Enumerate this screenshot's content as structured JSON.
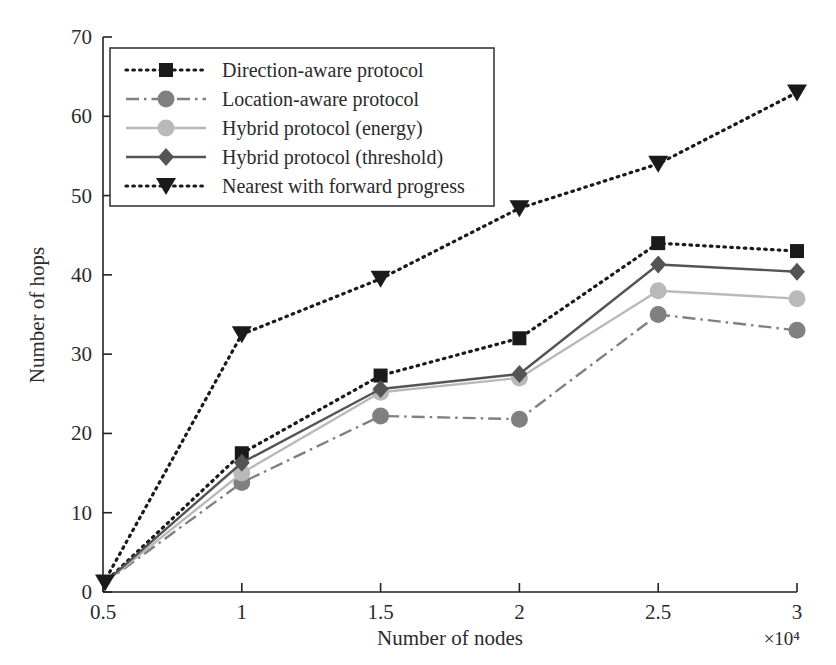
{
  "chart_data": {
    "type": "line",
    "title": "",
    "xlabel": "Number of nodes",
    "ylabel": "Number of hops",
    "x_exponent_label": "×10⁴",
    "x": [
      0.5,
      1,
      1.5,
      2,
      2.5,
      3
    ],
    "xticklabels": [
      "0.5",
      "1",
      "1.5",
      "2",
      "2.5",
      "3"
    ],
    "yticklabels": [
      "0",
      "10",
      "20",
      "30",
      "40",
      "50",
      "60",
      "70"
    ],
    "yticks": [
      0,
      10,
      20,
      30,
      40,
      50,
      60,
      70
    ],
    "xlim": [
      0.5,
      3
    ],
    "ylim": [
      0,
      70
    ],
    "grid": false,
    "legend_position": "upper-left",
    "series": [
      {
        "name": "Direction-aware protocol",
        "values": [
          1,
          17.5,
          27.3,
          32.0,
          44.0,
          43.0
        ],
        "color": "#1a1a1a",
        "marker": "square",
        "linestyle": "dotted"
      },
      {
        "name": "Location-aware protocol",
        "values": [
          1,
          13.8,
          22.2,
          21.8,
          35.0,
          33.0
        ],
        "color": "#808080",
        "marker": "circle",
        "linestyle": "dashdot"
      },
      {
        "name": "Hybrid protocol (energy)",
        "values": [
          1,
          15.0,
          25.2,
          27.0,
          38.0,
          37.0
        ],
        "color": "#b9b9b9",
        "marker": "circle",
        "linestyle": "solid"
      },
      {
        "name": "Hybrid protocol (threshold)",
        "values": [
          1,
          16.3,
          25.6,
          27.5,
          41.3,
          40.4
        ],
        "color": "#545454",
        "marker": "diamond",
        "linestyle": "solid"
      },
      {
        "name": "Nearest with forward progress",
        "values": [
          1,
          32.5,
          39.5,
          48.4,
          54.0,
          63.0
        ],
        "color": "#1a1a1a",
        "marker": "triangle-down",
        "linestyle": "dotted"
      }
    ]
  },
  "axes": {
    "y_title": "Number of hops",
    "x_title": "Number of nodes",
    "x_exponent": "×10⁴"
  }
}
